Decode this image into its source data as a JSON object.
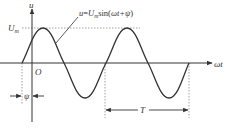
{
  "diagram": {
    "type": "sinusoidal-waveform",
    "axes": {
      "y_label": "u",
      "x_label": "ωt",
      "origin_label": "O"
    },
    "amplitude_label": {
      "main": "U",
      "sub": "m"
    },
    "equation": {
      "lhs": "u",
      "eq": "=",
      "U": "U",
      "sub": "m",
      "func": "sin(",
      "arg": "ωt+ψ",
      "close": ")"
    },
    "phase_label": "ψ",
    "period_label": "T",
    "colors": {
      "curve": "#333333",
      "axis": "#333333",
      "guide": "#888888"
    }
  }
}
